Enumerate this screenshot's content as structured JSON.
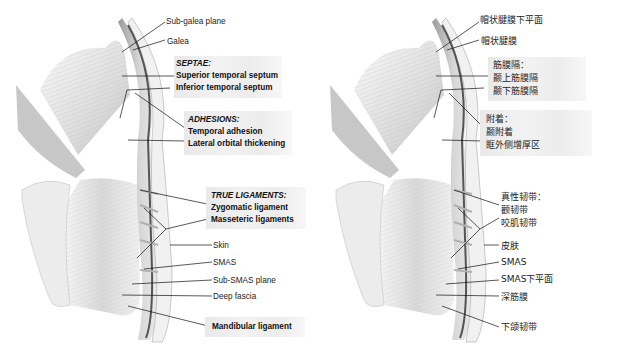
{
  "figure": {
    "colors": {
      "background": "#ffffff",
      "label_box": "#eeeeee",
      "leader_line": "#111111",
      "text": "#222222"
    }
  },
  "left_panel": {
    "language": "en",
    "labels": {
      "sub_galea_plane": "Sub-galea plane",
      "galea": "Galea",
      "septae_header": "SEPTAE:",
      "superior_temporal_septum": "Superior temporal septum",
      "inferior_temporal_septum": "Inferior temporal septum",
      "adhesions_header": "ADHESIONS:",
      "temporal_adhesion": "Temporal adhesion",
      "lateral_orbital_thickening": "Lateral orbital thickening",
      "true_ligaments_header": "TRUE LIGAMENTS:",
      "zygomatic_ligament": "Zygomatic ligament",
      "masseteric_ligaments": "Masseteric ligaments",
      "skin": "Skin",
      "smas": "SMAS",
      "sub_smas_plane": "Sub-SMAS plane",
      "deep_fascia": "Deep fascia",
      "mandibular_ligament": "Mandibular ligament"
    }
  },
  "right_panel": {
    "language": "zh",
    "labels": {
      "sub_galea_plane": "帽状腱膜下平面",
      "galea": "帽状腱膜",
      "septae_header": "筋膜隔：",
      "superior_temporal_septum": "颞上筋膜隔",
      "inferior_temporal_septum": "颞下筋膜隔",
      "adhesions_header": "附着：",
      "temporal_adhesion": "颞附着",
      "lateral_orbital_thickening": "眶外侧增厚区",
      "true_ligaments_header": "真性韧带：",
      "zygomatic_ligament": "颧韧带",
      "masseteric_ligaments": "咬肌韧带",
      "skin": "皮肤",
      "smas": "SMAS",
      "sub_smas_plane": "SMAS下平面",
      "deep_fascia": "深筋膜",
      "mandibular_ligament": "下颌韧带"
    }
  }
}
